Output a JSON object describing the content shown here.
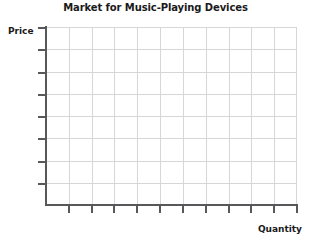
{
  "chart_data": {
    "type": "line",
    "title": "Market for Music-Playing Devices",
    "xlabel": "Quantity",
    "ylabel": "Price",
    "grid": true,
    "legend": null,
    "x_tick_labels": [],
    "y_tick_labels": [],
    "x_tick_count": 11,
    "y_tick_count": 8,
    "x_grid_divisions": 11,
    "y_grid_divisions": 8,
    "series": [],
    "values": [],
    "categories": [],
    "annotations": [],
    "note": "Empty supply-and-demand axes; no curves or data points are plotted."
  },
  "figure": {
    "title": "Market for Music-Playing Devices",
    "y_axis_label": "Price",
    "x_axis_label": "Quantity"
  },
  "colors": {
    "axis": "#58585b",
    "grid": "#d6d6d8",
    "text": "#1a1a1a",
    "background": "#ffffff"
  }
}
